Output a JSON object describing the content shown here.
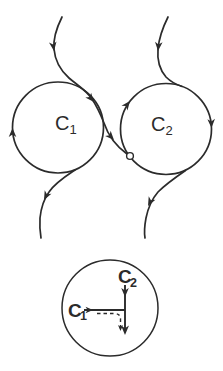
{
  "figure": {
    "colors": {
      "ink": "#2b2b2b",
      "background": "#ffffff"
    },
    "top": {
      "circle_c1": {
        "cx": 58,
        "cy": 127.5,
        "r": 45.5
      },
      "circle_c2": {
        "cx": 166,
        "cy": 129,
        "r": 45.5
      },
      "label_c1": {
        "base": "C",
        "sub": "1",
        "x": 55,
        "y": 130,
        "sx": 69.5,
        "sy": 134
      },
      "label_c2": {
        "base": "C",
        "sub": "2",
        "x": 151,
        "y": 131,
        "sx": 165.5,
        "sy": 135
      },
      "trajectory_in_left_d": "M 62 17 C 57 27 53 38 54 49 C 55 61 60 70 69 78 C 77 85 86 90 92 99 C 96 105 100 113 104 123 C 108 135 116 146 127 154",
      "trajectory_in_right_d": "M 168 17 C 163 27 159 38 158 49 C 157 60 160 70 166 77 C 171 82 176 84.5 182 86.5",
      "trajectory_out_left_d": "M 75 170 C 66 176 55 183 49 192 C 44 199 41 208 40 218 C 39.5 226 40 232 41 238",
      "trajectory_out_right_d": "M 185.5 170.5 C 176 177 166 184 158 192 C 152 199 148 208 146 218 C 144.5 226 144 232 145 238",
      "rest_point": {
        "cx": 130,
        "cy": 156,
        "r": 3.4
      }
    },
    "inset": {
      "circle": {
        "cx": 110,
        "cy": 308,
        "r": 48
      },
      "label_c1": {
        "base": "C",
        "sub": "1",
        "x": 68,
        "y": 316.5,
        "sx": 80,
        "sy": 320
      },
      "label_c2": {
        "base": "C",
        "sub": "2",
        "x": 118,
        "y": 283,
        "sx": 130,
        "sy": 286.5
      },
      "line_c2_d": "M 125 285 L 125 331",
      "line_c1_d": "M 84 310 L 125 310",
      "dashed_d": "M 97 313.5 L 114 313.5 Q 120.5 313.5 120.5 319 L 120.5 329",
      "dash_pattern": "3.5,3"
    },
    "arrows": [
      {
        "name": "arrow-incoming-left-upper",
        "x": 54,
        "y": 51,
        "angle": 82,
        "size": 9
      },
      {
        "name": "arrow-incoming-left-tangent",
        "x": 94,
        "y": 102,
        "angle": 50,
        "size": 9
      },
      {
        "name": "arrow-incoming-left-final",
        "x": 114,
        "y": 140,
        "angle": 47,
        "size": 9
      },
      {
        "name": "arrow-cycle-c1-left",
        "x": 12.5,
        "y": 128,
        "angle": -90,
        "size": 9
      },
      {
        "name": "arrow-incoming-right-upper",
        "x": 158,
        "y": 51,
        "angle": 95,
        "size": 9
      },
      {
        "name": "arrow-cycle-c2-upper-left",
        "x": 130,
        "y": 101,
        "angle": -52,
        "size": 9
      },
      {
        "name": "arrow-cycle-c2-right",
        "x": 211.5,
        "y": 128,
        "angle": 88,
        "size": 9
      },
      {
        "name": "arrow-outgoing-left",
        "x": 44,
        "y": 200,
        "angle": 117,
        "size": 9
      },
      {
        "name": "arrow-outgoing-right",
        "x": 148,
        "y": 206,
        "angle": 117,
        "size": 9
      },
      {
        "name": "arrow-inset-c1",
        "x": 93,
        "y": 310,
        "angle": 0,
        "size": 7.5
      },
      {
        "name": "arrow-inset-c2-upper",
        "x": 125,
        "y": 297,
        "angle": 90,
        "size": 9
      },
      {
        "name": "arrow-inset-c2-lower",
        "x": 125,
        "y": 335,
        "angle": 90,
        "size": 9.5
      },
      {
        "name": "arrow-inset-dashed",
        "x": 120.5,
        "y": 331,
        "angle": 90,
        "size": 6
      }
    ]
  }
}
